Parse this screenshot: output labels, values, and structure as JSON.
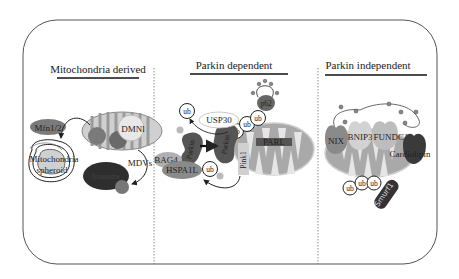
{
  "panels": [
    {
      "title": "Mitochondria derived"
    },
    {
      "title": "Parkin dependent"
    },
    {
      "title": "Parkin independent"
    }
  ],
  "mito_derived": {
    "mfn": "Mfn1/2",
    "dmnl": "DMNl",
    "spheroid_line1": "Mitochondria",
    "spheroid_line2": "spheroid",
    "mdvs": "MDVs",
    "lysosome": "lysosome"
  },
  "parkin_dependent": {
    "ub": "ub",
    "usp30": "USP30",
    "p62": "p62",
    "parkin": "Parkin",
    "pink1": "Pink1",
    "parl": "PARL",
    "bag4": "BAG4",
    "hspa1l": "HSPA1L",
    "p": "P"
  },
  "parkin_independent": {
    "nix": "NIX",
    "bnip3": "BNIP3",
    "fundc1": "FUNDC1",
    "cardiolipin": "Cardiolipin",
    "ub": "ub",
    "smurf1": "Smurf1"
  },
  "colors": {
    "frame": "#555555",
    "mito_fill": "#a9a9a9",
    "mito_light": "#d9d9d9",
    "dark": "#333333",
    "mid": "#7a7a7a",
    "light": "#c8c8c8"
  }
}
